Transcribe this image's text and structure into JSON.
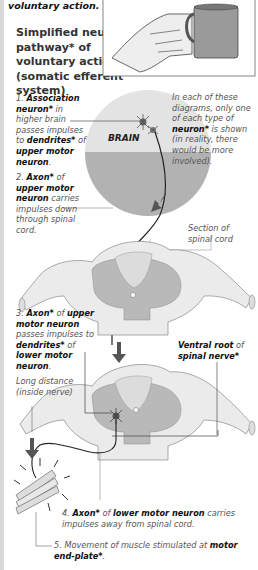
{
  "title": "voluntary action.",
  "heading": "Simplified neural pathway* of voluntary action (somatic efferent system)",
  "illustration": {
    "image": "hand-holding-mug",
    "brain_label": "BRAIN"
  },
  "note": {
    "pre": "In each of these diagrams, only one of each type of ",
    "bold": "neuron*",
    "post": " is shown (in reality, there would be more involved)."
  },
  "steps": [
    {
      "num": "1.",
      "parts": [
        [
          "b",
          "Association neuron*"
        ],
        [
          "i",
          " in higher brain passes impulses to "
        ],
        [
          "b",
          "dendrites*"
        ],
        [
          "i",
          " of "
        ],
        [
          "b",
          "upper motor neuron"
        ],
        [
          "i",
          "."
        ]
      ]
    },
    {
      "num": "2.",
      "parts": [
        [
          "b",
          "Axon*"
        ],
        [
          "i",
          " of "
        ],
        [
          "b",
          "upper motor neuron"
        ],
        [
          "i",
          " carries impulses down through spinal cord."
        ]
      ]
    },
    {
      "num": "3.",
      "parts": [
        [
          "b",
          "Axon*"
        ],
        [
          "i",
          " of "
        ],
        [
          "b",
          "upper motor neuron"
        ],
        [
          "i",
          " passes impulses to "
        ],
        [
          "b",
          "dendrites*"
        ],
        [
          "i",
          " of "
        ],
        [
          "b",
          "lower motor neuron"
        ],
        [
          "i",
          "."
        ]
      ]
    },
    {
      "num": "4.",
      "parts": [
        [
          "b",
          "Axon*"
        ],
        [
          "i",
          " of "
        ],
        [
          "b",
          "lower motor neuron"
        ],
        [
          "i",
          " carries impulses away from spinal cord."
        ]
      ]
    },
    {
      "num": "5.",
      "parts": [
        [
          "i",
          "Movement of muscle stimulated at "
        ],
        [
          "b",
          "motor end-plate*"
        ],
        [
          "i",
          "."
        ]
      ]
    }
  ],
  "labels": {
    "section_spinal_cord": "Section of spinal cord",
    "ventral_root_bold": "Ventral root",
    "ventral_root_of": " of",
    "spinal_nerve": "spinal nerve*",
    "long_distance": "Long distance (inside nerve)"
  },
  "colors": {
    "outline": "#555555",
    "fill_light": "#e6e6e6",
    "fill_grey": "#b5b5b5",
    "brain_top": "#e4e4e4",
    "brain_bottom": "#b0b0b0",
    "arrow": "#555555"
  }
}
